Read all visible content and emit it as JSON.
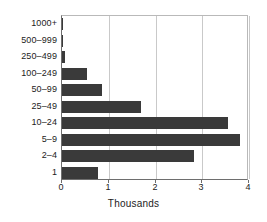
{
  "chart_data": {
    "type": "bar",
    "orientation": "horizontal",
    "title": "",
    "xlabel": "Thousands",
    "ylabel": "",
    "categories": [
      "1000+",
      "500–999",
      "250–499",
      "100–249",
      "50–99",
      "25–49",
      "10–24",
      "5–9",
      "2–4",
      "1"
    ],
    "values": [
      0.03,
      0.02,
      0.07,
      0.53,
      0.85,
      1.68,
      3.55,
      3.8,
      2.82,
      0.76
    ],
    "xlim": [
      0,
      4
    ],
    "xticks": [
      0,
      1,
      2,
      3,
      4
    ],
    "xtick_labels": [
      "0",
      "1",
      "2",
      "3",
      "4"
    ],
    "grid": "vertical",
    "legend": "none",
    "bar_color": "#3a3a3a",
    "grid_color": "#c9c9c9",
    "axis_color": "#6e6e6e",
    "background_color": "#ffffff"
  },
  "axis": {
    "x_title": "Thousands"
  }
}
